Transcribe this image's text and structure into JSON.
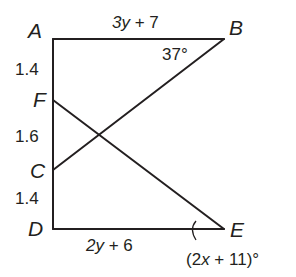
{
  "diagram": {
    "type": "geometry",
    "stroke_color": "#231f20",
    "points": {
      "A": {
        "label": "A",
        "x": 53,
        "y": 39
      },
      "B": {
        "label": "B",
        "x": 224,
        "y": 39
      },
      "F": {
        "label": "F",
        "x": 53,
        "y": 100
      },
      "C": {
        "label": "C",
        "x": 53,
        "y": 170
      },
      "D": {
        "label": "D",
        "x": 53,
        "y": 229
      },
      "E": {
        "label": "E",
        "x": 224,
        "y": 229
      }
    },
    "segments": [
      "AD",
      "AB",
      "DE",
      "BC",
      "FE"
    ],
    "labels": {
      "AB": {
        "var": "3y",
        "rest": " + 7"
      },
      "DE": {
        "var": "2y",
        "rest": " + 6"
      },
      "AF": "1.4",
      "FC": "1.6",
      "CD": "1.4",
      "angle_B": "37°",
      "angle_E_open": "(2",
      "angle_E_var": "x",
      "angle_E_rest": " + 11)°"
    }
  }
}
